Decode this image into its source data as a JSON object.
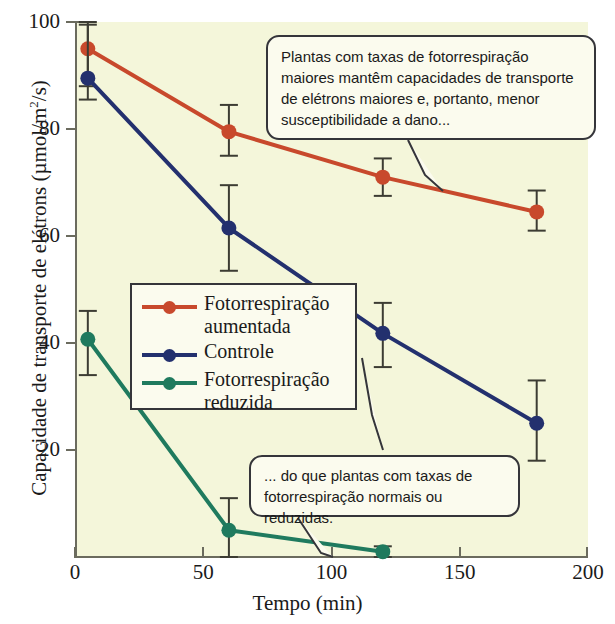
{
  "chart_data": {
    "type": "line",
    "title": "",
    "xlabel": "Tempo (min)",
    "ylabel": "Capacidade de transporte de elétrons (µmol/m2/s)",
    "ylabel_parts": {
      "main": "Capacidade de transporte de elétrons (µmol/m",
      "exponent": "2",
      "tail": "/s)"
    },
    "xlim": [
      0,
      200
    ],
    "ylim": [
      0,
      100
    ],
    "xticks": [
      0,
      50,
      100,
      150,
      200
    ],
    "yticks": [
      20,
      40,
      60,
      80,
      100
    ],
    "xtick_labels": [
      "0",
      "50",
      "100",
      "150",
      "200"
    ],
    "ytick_labels": [
      "20",
      "40",
      "60",
      "80",
      "100"
    ],
    "grid": false,
    "legend_position": "center-left",
    "x": [
      5,
      60,
      120,
      180
    ],
    "series": [
      {
        "name": "Fotorrespiração aumentada",
        "color": "#c8492c",
        "x": [
          5,
          60,
          120,
          180
        ],
        "values": [
          95,
          79.5,
          71,
          64.5
        ],
        "error_low": [
          88,
          75,
          67.5,
          61
        ],
        "error_high": [
          100,
          84.5,
          74.5,
          68.5
        ]
      },
      {
        "name": "Controle",
        "color": "#23306e",
        "x": [
          5,
          60,
          120,
          180
        ],
        "values": [
          89.5,
          61.5,
          41.8,
          25
        ],
        "error_low": [
          85.5,
          53.5,
          35.5,
          18
        ],
        "error_high": [
          99.5,
          69.5,
          47.5,
          33
        ]
      },
      {
        "name": "Fotorrespiração reduzida",
        "color": "#1f7a5e",
        "x": [
          5,
          60,
          120
        ],
        "values": [
          40.7,
          5,
          1
        ],
        "error_low": [
          34,
          0,
          0
        ],
        "error_high": [
          46,
          11,
          2
        ]
      }
    ],
    "annotations": [
      {
        "id": "callout-top",
        "text": "Plantas com taxas de fotorrespiração maiores mantêm capacidades de transporte de elétrons maiores e, portanto, menor susceptibilidade a dano..."
      },
      {
        "id": "callout-bottom",
        "text": "... do que plantas com taxas de fotorrespiração normais ou reduzidas."
      }
    ],
    "background_color": "#f4f6da",
    "axis_color": "#6b6b5e"
  },
  "legend": {
    "entries": [
      {
        "label_line1": "Fotorrespiração",
        "label_line2": "aumentada",
        "color": "#c8492c"
      },
      {
        "label_line1": "Controle",
        "label_line2": "",
        "color": "#23306e"
      },
      {
        "label_line1": "Fotorrespiração",
        "label_line2": "reduzida",
        "color": "#1f7a5e"
      }
    ]
  },
  "axes": {
    "x_title": "Tempo (min)",
    "y_title_main": "Capacidade de transporte de elétrons (µmol/m",
    "y_title_exp": "2",
    "y_title_tail": "/s)"
  },
  "callouts": {
    "top": "Plantas com taxas de fotorrespiração maiores mantêm capacidades de transporte de elétrons maiores e, portanto, menor susceptibilidade a dano...",
    "bottom": "... do que plantas com taxas de fotorrespiração normais ou reduzidas."
  }
}
